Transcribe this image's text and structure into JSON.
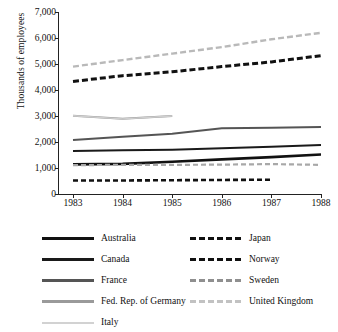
{
  "chart_data": {
    "type": "line",
    "title": "",
    "xlabel": "",
    "ylabel": "Thousands of employees",
    "categories": [
      "1983",
      "1984",
      "1985",
      "1986",
      "1987",
      "1988"
    ],
    "x": [
      1983,
      1984,
      1985,
      1986,
      1987,
      1988
    ],
    "ylim": [
      0,
      7000
    ],
    "yticks": [
      0,
      1000,
      2000,
      3000,
      4000,
      5000,
      6000,
      7000
    ],
    "ytick_labels": [
      "0",
      "1,000",
      "2,000",
      "3,000",
      "4,000",
      "5,000",
      "6,000",
      "7,000"
    ],
    "grid": false,
    "legend_position": "bottom",
    "series": [
      {
        "name": "Australia",
        "x": [
          1983,
          1984,
          1985,
          1986,
          1987,
          1988
        ],
        "values": [
          1140,
          1160,
          1240,
          1330,
          1420,
          1520
        ],
        "color": "#111111",
        "style": "solid",
        "width": 2.6
      },
      {
        "name": "Canada",
        "x": [
          1983,
          1984,
          1985,
          1986,
          1987,
          1988
        ],
        "values": [
          1650,
          1680,
          1700,
          1760,
          1820,
          1880
        ],
        "color": "#1a1a1a",
        "style": "solid",
        "width": 2.0
      },
      {
        "name": "France",
        "x": [
          1983,
          1984,
          1985,
          1986,
          1987,
          1988
        ],
        "values": [
          2080,
          2200,
          2320,
          2530,
          2550,
          2580
        ],
        "color": "#555555",
        "style": "solid",
        "width": 2.0
      },
      {
        "name": "Fed. Rep. of Germany",
        "x": [
          1983,
          1984,
          1985
        ],
        "values": [
          3010,
          2890,
          3000
        ],
        "color": "#9a9a9a",
        "style": "solid",
        "width": 2.0
      },
      {
        "name": "Italy",
        "x": [
          1983,
          1984,
          1985
        ],
        "values": [
          3010,
          2890,
          3000
        ],
        "color": "#cfcfcf",
        "style": "solid",
        "width": 1.4
      },
      {
        "name": "Japan",
        "x": [
          1983,
          1984,
          1985,
          1986,
          1987,
          1988
        ],
        "values": [
          4330,
          4550,
          4700,
          4900,
          5080,
          5320
        ],
        "color": "#111111",
        "style": "dashed",
        "width": 3.0,
        "dash": "6,3"
      },
      {
        "name": "Norway",
        "x": [
          1983,
          1984,
          1985,
          1986,
          1987
        ],
        "values": [
          520,
          520,
          530,
          540,
          550
        ],
        "color": "#111111",
        "style": "dashed",
        "width": 2.6,
        "dash": "5,3"
      },
      {
        "name": "Sweden",
        "x": [
          1983,
          1984,
          1985,
          1986,
          1987,
          1988
        ],
        "values": [
          1110,
          1120,
          1120,
          1130,
          1150,
          1120
        ],
        "color": "#a8a8a8",
        "style": "dashed",
        "width": 2.2,
        "dash": "5,3"
      },
      {
        "name": "United Kingdom",
        "x": [
          1983,
          1984,
          1985,
          1986,
          1987,
          1988
        ],
        "values": [
          4900,
          5150,
          5400,
          5650,
          5950,
          6200
        ],
        "color": "#b9b9b9",
        "style": "dashed",
        "width": 2.4,
        "dash": "6,3"
      }
    ]
  },
  "legend": {
    "left_column": [
      {
        "label": "Australia",
        "color": "#111111",
        "style": "solid",
        "width": 3.2,
        "dash": ""
      },
      {
        "label": "Canada",
        "color": "#1a1a1a",
        "style": "solid",
        "width": 2.6,
        "dash": ""
      },
      {
        "label": "France",
        "color": "#555555",
        "style": "solid",
        "width": 2.6,
        "dash": ""
      },
      {
        "label": "Fed. Rep. of Germany",
        "color": "#9a9a9a",
        "style": "solid",
        "width": 2.4,
        "dash": ""
      },
      {
        "label": "Italy",
        "color": "#d2d2d2",
        "style": "solid",
        "width": 2.0,
        "dash": ""
      }
    ],
    "right_column": [
      {
        "label": "Japan",
        "color": "#111111",
        "style": "dashed",
        "width": 3.2,
        "dash": "6,3"
      },
      {
        "label": "Norway",
        "color": "#111111",
        "style": "dashed",
        "width": 2.8,
        "dash": "6,3"
      },
      {
        "label": "Sweden",
        "color": "#8f8f8f",
        "style": "dashed",
        "width": 2.4,
        "dash": "6,3"
      },
      {
        "label": "United Kingdom",
        "color": "#c2c2c2",
        "style": "dashed",
        "width": 2.2,
        "dash": "6,3"
      }
    ]
  }
}
